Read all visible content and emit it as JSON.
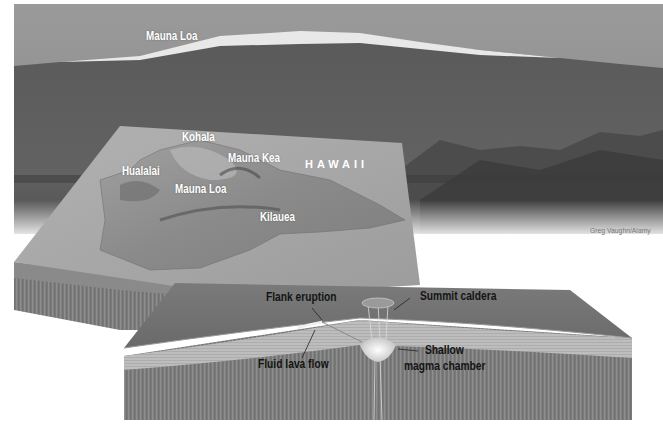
{
  "figure": {
    "photo": {
      "label": "Mauna Loa",
      "credit": "Greg Vaughn/Alamy"
    },
    "map": {
      "island_label": "HAWAII",
      "volcanoes": [
        {
          "name": "Kohala"
        },
        {
          "name": "Mauna Kea"
        },
        {
          "name": "Hualalai"
        },
        {
          "name": "Mauna Loa"
        },
        {
          "name": "Kilauea"
        }
      ]
    },
    "cross_section": {
      "labels": {
        "flank_eruption": "Flank eruption",
        "summit_caldera": "Summit caldera",
        "fluid_lava_flow": "Fluid lava flow",
        "magma_chamber_line1": "Shallow",
        "magma_chamber_line2": "magma chamber"
      }
    },
    "colors": {
      "sky": "#8f8f8f",
      "mountain": "#5c5c5c",
      "snow": "#eeeeee",
      "plate_top": "#a9a9a9",
      "plate_side": "#7a7a7a",
      "strata": "#b8b8b8",
      "magma": "#f2f2f2"
    }
  }
}
